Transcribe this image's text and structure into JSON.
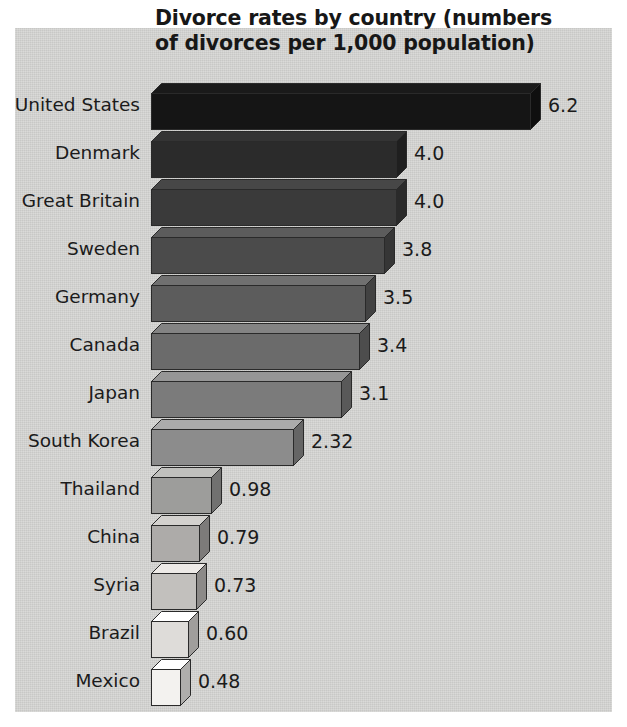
{
  "chart_data": {
    "type": "bar",
    "orientation": "horizontal",
    "style": "3d-bar",
    "title": "Divorce rates by country (numbers of divorces per 1,000 population)",
    "title_lines": [
      "Divorce rates by country (numbers",
      "of divorces per 1,000 population)"
    ],
    "xlabel": "",
    "ylabel": "",
    "xlim": [
      0,
      6.2
    ],
    "grid": false,
    "legend": false,
    "categories": [
      "United States",
      "Denmark",
      "Great Britain",
      "Sweden",
      "Germany",
      "Canada",
      "Japan",
      "South Korea",
      "Thailand",
      "China",
      "Syria",
      "Brazil",
      "Mexico"
    ],
    "values": [
      6.2,
      4.0,
      4.0,
      3.8,
      3.5,
      3.4,
      3.1,
      2.32,
      0.98,
      0.79,
      0.73,
      0.6,
      0.48
    ],
    "value_labels": [
      "6.2",
      "4.0",
      "4.0",
      "3.8",
      "3.5",
      "3.4",
      "3.1",
      "2.32",
      "0.98",
      "0.79",
      "0.73",
      "0.60",
      "0.48"
    ],
    "bar_colors": [
      "#151515",
      "#2b2b2b",
      "#3a3a3a",
      "#4b4b4b",
      "#5c5c5c",
      "#6b6b6b",
      "#7b7b7b",
      "#8c8c8c",
      "#9d9d9b",
      "#adaba9",
      "#c2c0bd",
      "#dedcd9",
      "#f3f2ef"
    ],
    "background_color": "#d6d6d4",
    "text_color": "#1b1b1b"
  }
}
